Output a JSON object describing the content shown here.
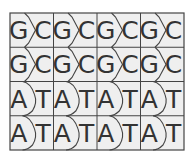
{
  "colors": {
    "background": "#ffffff",
    "cell_fill": "#efefef",
    "line": "#444444",
    "text": "#333333"
  },
  "grid": {
    "left": 10,
    "top": 13,
    "cell_width": 43.5,
    "row_height": 34.25,
    "columns": 4,
    "rows": 4
  },
  "rows": [
    {
      "pair": "GC",
      "shape": "chevron",
      "cells": [
        {
          "left": "G",
          "right": "C"
        },
        {
          "left": "G",
          "right": "C"
        },
        {
          "left": "G",
          "right": "C"
        },
        {
          "left": "G",
          "right": "C"
        }
      ]
    },
    {
      "pair": "GC",
      "shape": "chevron",
      "cells": [
        {
          "left": "G",
          "right": "C"
        },
        {
          "left": "G",
          "right": "C"
        },
        {
          "left": "G",
          "right": "C"
        },
        {
          "left": "G",
          "right": "C"
        }
      ]
    },
    {
      "pair": "AT",
      "shape": "semicircle",
      "cells": [
        {
          "left": "A",
          "right": "T"
        },
        {
          "left": "A",
          "right": "T"
        },
        {
          "left": "A",
          "right": "T"
        },
        {
          "left": "A",
          "right": "T"
        }
      ]
    },
    {
      "pair": "AT",
      "shape": "semicircle",
      "cells": [
        {
          "left": "A",
          "right": "T"
        },
        {
          "left": "A",
          "right": "T"
        },
        {
          "left": "A",
          "right": "T"
        },
        {
          "left": "A",
          "right": "T"
        }
      ]
    }
  ]
}
